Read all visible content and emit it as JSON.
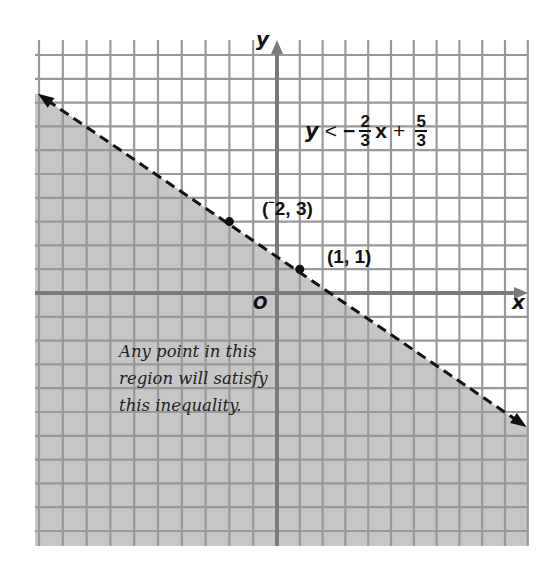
{
  "figure": {
    "axis_labels": {
      "x": "x",
      "y": "y",
      "origin": "O"
    },
    "points": [
      {
        "label_open": "(",
        "label_sup": "−",
        "label_rest": "2, 3)",
        "x": -2,
        "y": 3
      },
      {
        "label": "(1, 1)",
        "x": 1,
        "y": 1
      }
    ],
    "inequality": {
      "lhs": "y",
      "relation": "<",
      "neg": "−",
      "slope_num": "2",
      "slope_den": "3",
      "var": "x",
      "plus": "+",
      "int_num": "5",
      "int_den": "3"
    },
    "note_lines": [
      "Any point in this",
      "region will satisfy",
      "this inequality."
    ],
    "colors": {
      "shade": "#c6c6c6",
      "grid": "#999999",
      "axis": "#7a7a7a",
      "line": "#111111",
      "paper": "#ffffff"
    }
  },
  "chart_data": {
    "type": "line",
    "boundary": {
      "slope": -0.6667,
      "intercept": 1.6667,
      "style": "dashed",
      "arrows": "both"
    },
    "shaded_region": "below boundary line",
    "points": [
      {
        "x": -2,
        "y": 3
      },
      {
        "x": 1,
        "y": 1
      }
    ],
    "xlabel": "x",
    "ylabel": "y",
    "xlim": [
      -10.2,
      10.6
    ],
    "ylim": [
      -10.5,
      10.6
    ],
    "grid": true,
    "grid_step": 1,
    "annotation": "Any point in this region will satisfy this inequality."
  }
}
